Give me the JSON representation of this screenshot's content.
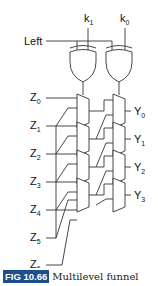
{
  "diagram": {
    "control_inputs": {
      "left": "Left",
      "k1": "k",
      "k1_sub": "1",
      "k0": "k",
      "k0_sub": "0"
    },
    "z_inputs": [
      {
        "label": "Z",
        "sub": "0"
      },
      {
        "label": "Z",
        "sub": "1"
      },
      {
        "label": "Z",
        "sub": "2"
      },
      {
        "label": "Z",
        "sub": "3"
      },
      {
        "label": "Z",
        "sub": "4"
      },
      {
        "label": "Z",
        "sub": "5"
      },
      {
        "label": "Z",
        "sub": "6"
      }
    ],
    "y_outputs": [
      {
        "label": "Y",
        "sub": "0"
      },
      {
        "label": "Y",
        "sub": "1"
      },
      {
        "label": "Y",
        "sub": "2"
      },
      {
        "label": "Y",
        "sub": "3"
      }
    ],
    "gates": [
      "XOR",
      "XOR"
    ],
    "mux_levels": 2,
    "muxes_per_level": 4
  },
  "caption": {
    "figure_number": "FIG 10.66",
    "title": "Multilevel funnel",
    "badge_color": "#1f4e8c"
  }
}
